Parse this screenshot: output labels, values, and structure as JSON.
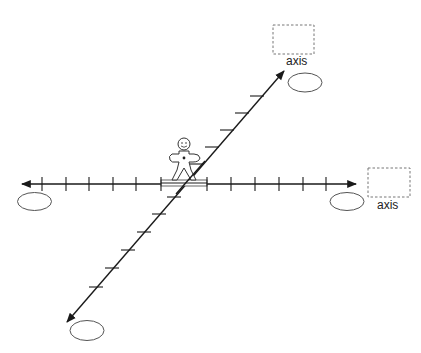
{
  "diagram": {
    "type": "3d-coordinate-axes-worksheet",
    "colors": {
      "line": "#1a1a1a",
      "ellipse_stroke": "#555555",
      "dashed_box_stroke": "#777777",
      "background": "#ffffff"
    },
    "axes": {
      "horizontal": {
        "label_box": {
          "label": "axis"
        },
        "ticks_left": 6,
        "ticks_right": 6
      },
      "diagonal": {
        "label_box": {
          "label": "axis"
        },
        "ticks_upper": 6,
        "ticks_lower": 6
      }
    },
    "answer_ellipses": [
      "left-end",
      "right-end",
      "upper-end",
      "lower-end"
    ],
    "figure": {
      "name": "person-standing-on-origin-platform"
    }
  }
}
